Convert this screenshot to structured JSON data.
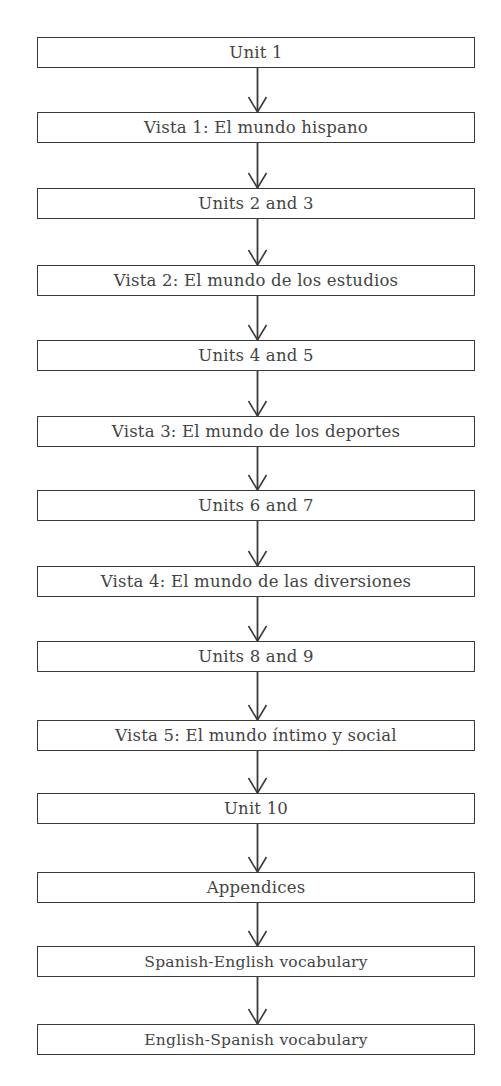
{
  "diagram": {
    "type": "flowchart",
    "direction": "top-to-bottom",
    "colors": {
      "stroke": "#3a3a3a",
      "text": "#444444",
      "background": "#ffffff"
    },
    "nodes": [
      {
        "id": "n1",
        "label": "Unit 1",
        "top": 37
      },
      {
        "id": "n2",
        "label": "Vista 1: El mundo hispano",
        "top": 112
      },
      {
        "id": "n3",
        "label": "Units 2 and 3",
        "top": 188
      },
      {
        "id": "n4",
        "label": "Vista 2: El mundo de los estudios",
        "top": 265
      },
      {
        "id": "n5",
        "label": "Units 4 and 5",
        "top": 340
      },
      {
        "id": "n6",
        "label": "Vista 3: El mundo de los deportes",
        "top": 416
      },
      {
        "id": "n7",
        "label": "Units 6 and 7",
        "top": 490
      },
      {
        "id": "n8",
        "label": "Vista 4: El mundo de las diversiones",
        "top": 566
      },
      {
        "id": "n9",
        "label": "Units 8 and 9",
        "top": 641
      },
      {
        "id": "n10",
        "label": "Vista 5: El mundo íntimo y social",
        "top": 720
      },
      {
        "id": "n11",
        "label": "Unit 10",
        "top": 793
      },
      {
        "id": "n12",
        "label": "Appendices",
        "top": 872
      },
      {
        "id": "n13",
        "label": "Spanish-English vocabulary",
        "top": 946
      },
      {
        "id": "n14",
        "label": "English-Spanish vocabulary",
        "top": 1024
      }
    ],
    "edges": [
      {
        "from": "n1",
        "to": "n2"
      },
      {
        "from": "n2",
        "to": "n3"
      },
      {
        "from": "n3",
        "to": "n4"
      },
      {
        "from": "n4",
        "to": "n5"
      },
      {
        "from": "n5",
        "to": "n6"
      },
      {
        "from": "n6",
        "to": "n7"
      },
      {
        "from": "n7",
        "to": "n8"
      },
      {
        "from": "n8",
        "to": "n9"
      },
      {
        "from": "n9",
        "to": "n10"
      },
      {
        "from": "n10",
        "to": "n11"
      },
      {
        "from": "n11",
        "to": "n12"
      },
      {
        "from": "n12",
        "to": "n13"
      },
      {
        "from": "n13",
        "to": "n14"
      }
    ]
  }
}
